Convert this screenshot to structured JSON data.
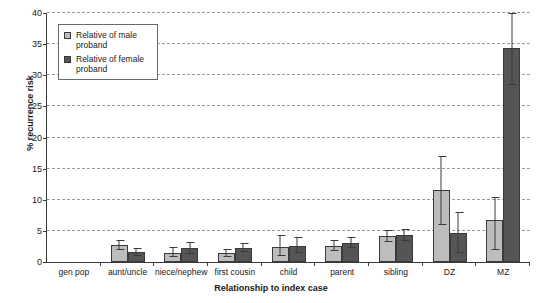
{
  "chart_data": {
    "type": "bar",
    "title": "",
    "xlabel": "Relationship to index case",
    "ylabel": "% recurrence risk",
    "ylim": [
      0,
      40
    ],
    "ytick_step": 5,
    "yticks": [
      0,
      5,
      10,
      15,
      20,
      25,
      30,
      35,
      40
    ],
    "grid": true,
    "legend_position": "top-left",
    "categories": [
      "gen pop",
      "aunt/uncle",
      "niece/nephew",
      "first cousin",
      "child",
      "parent",
      "sibling",
      "DZ",
      "MZ"
    ],
    "series": [
      {
        "name": "Relative of male proband",
        "color": "#bdbdbd",
        "values": [
          0,
          2.7,
          1.5,
          1.4,
          2.4,
          2.6,
          4.2,
          11.5,
          6.7
        ],
        "error_low": [
          0,
          1.9,
          0.8,
          0.8,
          1.0,
          1.8,
          3.2,
          6.0,
          2.0
        ],
        "error_high": [
          0,
          3.6,
          2.4,
          2.1,
          4.3,
          3.5,
          5.2,
          17.0,
          10.5
        ]
      },
      {
        "name": "Relative of female proband",
        "color": "#555555",
        "values": [
          0,
          1.6,
          2.2,
          2.3,
          2.6,
          3.1,
          4.3,
          4.6,
          34.3
        ],
        "error_low": [
          0,
          1.0,
          1.3,
          1.6,
          1.5,
          2.3,
          3.3,
          1.5,
          28.5
        ],
        "error_high": [
          0,
          2.3,
          3.2,
          3.1,
          4.0,
          4.0,
          5.3,
          8.0,
          40.0
        ]
      }
    ]
  },
  "legend": {
    "items": [
      {
        "label": "Relative of male proband"
      },
      {
        "label": "Relative of female proband"
      }
    ]
  }
}
